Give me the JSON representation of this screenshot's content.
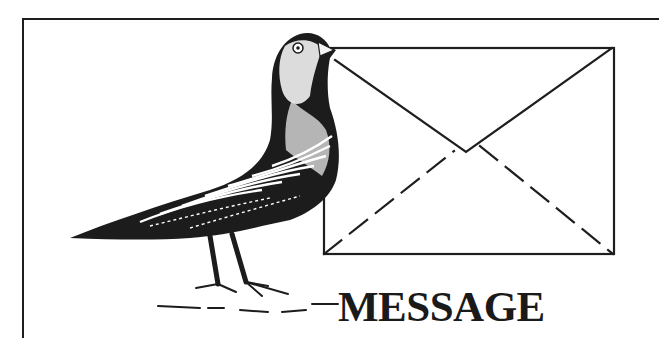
{
  "illustration": {
    "subject": "carrier pigeon holding an envelope in its beak",
    "icons": [
      "pigeon-icon",
      "envelope-icon"
    ],
    "colors": {
      "ink": "#1a1a1a",
      "paper": "#ffffff"
    }
  },
  "title": {
    "text": "MESSAGE"
  }
}
